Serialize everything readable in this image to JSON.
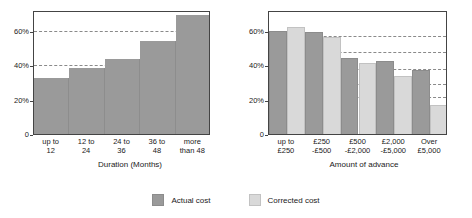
{
  "legend": {
    "items": [
      {
        "label": "Actual cost",
        "color": "#9a9a9a",
        "key": "actual"
      },
      {
        "label": "Corrected cost",
        "color": "#d9d9d9",
        "key": "corrected"
      }
    ]
  },
  "chart_data": [
    {
      "type": "bar",
      "id": "duration-chart",
      "title": "",
      "xlabel": "Duration (Months)",
      "ylabel": "",
      "categories": [
        "up to\n12",
        "12 to\n24",
        "24 to\n36",
        "36 to\n48",
        "more\nthan 48"
      ],
      "series": [
        {
          "name": "Actual cost",
          "values": [
            33,
            39,
            44,
            55,
            70
          ]
        }
      ],
      "ylim": [
        0,
        72
      ],
      "yticks": [
        0,
        20,
        40,
        60
      ],
      "yticklabels": [
        "0",
        "20%",
        "40%",
        "60%"
      ],
      "gridlines": [
        40,
        60
      ],
      "grid": true,
      "legend_position": "bottom",
      "style": "contiguous-step-columns"
    },
    {
      "type": "bar",
      "id": "advance-chart",
      "title": "",
      "xlabel": "Amount of advance",
      "ylabel": "",
      "categories": [
        "up to\n£250",
        "£250\n-£500",
        "£500\n-£2,000",
        "£2,000\n-£5,000",
        "Over\n£5,000"
      ],
      "series": [
        {
          "name": "Actual cost",
          "values": [
            61,
            60,
            45,
            43,
            38
          ]
        },
        {
          "name": "Corrected cost",
          "values": [
            63,
            57,
            42,
            34,
            17
          ]
        }
      ],
      "ylim": [
        0,
        72
      ],
      "yticks": [
        0,
        20,
        40,
        60
      ],
      "yticklabels": [
        "0",
        "20%",
        "40%",
        "60%"
      ],
      "gridlines": [
        57,
        48,
        38,
        29,
        21
      ],
      "grid": true,
      "legend_position": "bottom",
      "style": "grouped-bars"
    }
  ]
}
